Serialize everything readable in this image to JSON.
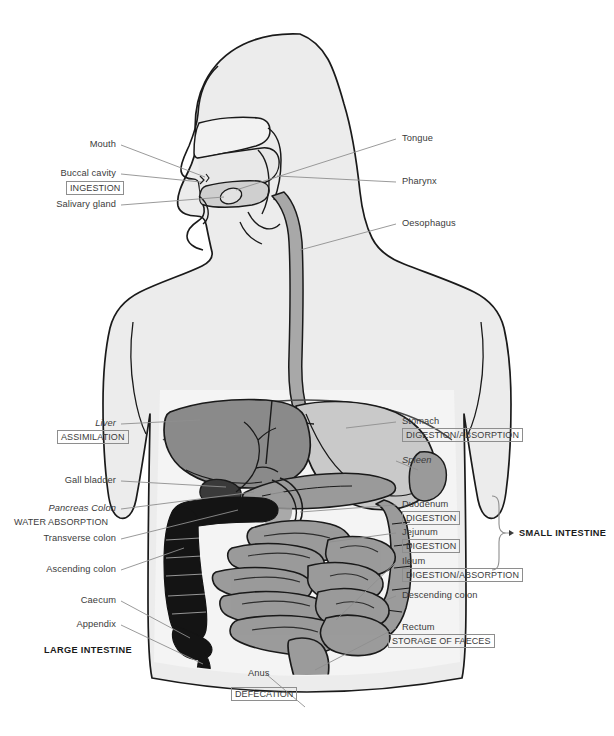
{
  "figure": {
    "orientation": "anterior view of torso with left-facing head profile"
  },
  "palette": {
    "outline": "#1a1a1a",
    "body_fill": "#ececec",
    "body_fill_light": "#f2f2f2",
    "cavity_fill": "#efefef",
    "liver": "#8a8a8a",
    "stomach": "#c9c9c9",
    "spleen": "#9a9a9a",
    "pancreas": "#9a9a9a",
    "gall_bladder": "#4a4a4a",
    "colon_dark": "#141414",
    "small_intestine": "#9b9b9b",
    "large_intestine_gray": "#9b9b9b",
    "oesophagus": "#a8a8a8",
    "leader_line": "#8e8e8e",
    "label_text": "#3b3b3b",
    "bold_text": "#1a1a1a"
  },
  "labels": {
    "left": [
      {
        "id": "mouth",
        "text": "Mouth",
        "style": "plain"
      },
      {
        "id": "buccal-cavity",
        "text": "Buccal cavity",
        "style": "plain"
      },
      {
        "id": "ingestion",
        "text": "INGESTION",
        "style": "boxed"
      },
      {
        "id": "salivary-gland",
        "text": "Salivary gland",
        "style": "plain"
      },
      {
        "id": "liver",
        "text": "Liver",
        "style": "italic"
      },
      {
        "id": "assimilation",
        "text": "ASSIMILATION",
        "style": "boxed"
      },
      {
        "id": "gall-bladder",
        "text": "Gall bladder",
        "style": "plain"
      },
      {
        "id": "pancreas-colon",
        "text": "Pancreas Colon",
        "style": "italic"
      },
      {
        "id": "water-absorption",
        "text": "WATER ABSORPTION",
        "style": "caps"
      },
      {
        "id": "transverse-colon",
        "text": "Transverse colon",
        "style": "plain"
      },
      {
        "id": "ascending-colon",
        "text": "Ascending colon",
        "style": "plain"
      },
      {
        "id": "caecum",
        "text": "Caecum",
        "style": "plain"
      },
      {
        "id": "appendix",
        "text": "Appendix",
        "style": "plain"
      },
      {
        "id": "large-intestine",
        "text": "LARGE INTESTINE",
        "style": "bold"
      }
    ],
    "right": [
      {
        "id": "tongue",
        "text": "Tongue",
        "style": "plain"
      },
      {
        "id": "pharynx",
        "text": "Pharynx",
        "style": "plain"
      },
      {
        "id": "oesophagus",
        "text": "Oesophagus",
        "style": "plain"
      },
      {
        "id": "stomach",
        "text": "Stomach",
        "style": "plain"
      },
      {
        "id": "stomach-function",
        "text": "DIGESTION/ABSORPTION",
        "style": "boxed"
      },
      {
        "id": "spleen",
        "text": "Spleen",
        "style": "italic"
      },
      {
        "id": "duodenum",
        "text": "Duodenum",
        "style": "plain"
      },
      {
        "id": "duodenum-function",
        "text": "DIGESTION",
        "style": "boxed"
      },
      {
        "id": "jejunum",
        "text": "Jejunum",
        "style": "plain"
      },
      {
        "id": "jejunum-function",
        "text": "DIGESTION",
        "style": "boxed"
      },
      {
        "id": "ileum",
        "text": "Ileum",
        "style": "plain"
      },
      {
        "id": "ileum-function",
        "text": "DIGESTION/ABSORPTION",
        "style": "boxed"
      },
      {
        "id": "small-intestine",
        "text": "SMALL INTESTINE",
        "style": "bold"
      },
      {
        "id": "descending-colon",
        "text": "Descending colon",
        "style": "plain"
      },
      {
        "id": "rectum",
        "text": "Rectum",
        "style": "plain"
      },
      {
        "id": "rectum-function",
        "text": "STORAGE OF FAECES",
        "style": "boxed"
      }
    ],
    "bottom": [
      {
        "id": "anus",
        "text": "Anus",
        "style": "plain"
      },
      {
        "id": "defecation",
        "text": "DEFECATION",
        "style": "boxed"
      }
    ]
  },
  "text": {
    "mouth": "Mouth",
    "buccal_cavity": "Buccal cavity",
    "ingestion": "INGESTION",
    "salivary_gland": "Salivary gland",
    "liver": "Liver",
    "assimilation": "ASSIMILATION",
    "gall_bladder": "Gall bladder",
    "pancreas_colon": "Pancreas Colon",
    "water_absorption": "WATER ABSORPTION",
    "transverse_colon": "Transverse colon",
    "ascending_colon": "Ascending colon",
    "caecum": "Caecum",
    "appendix": "Appendix",
    "large_intestine": "LARGE INTESTINE",
    "tongue": "Tongue",
    "pharynx": "Pharynx",
    "oesophagus": "Oesophagus",
    "stomach": "Stomach",
    "stomach_function": "DIGESTION/ABSORPTION",
    "spleen": "Spleen",
    "duodenum": "Duodenum",
    "duodenum_function": "DIGESTION",
    "jejunum": "Jejunum",
    "jejunum_function": "DIGESTION",
    "ileum": "Ileum",
    "ileum_function": "DIGESTION/ABSORPTION",
    "small_intestine": "SMALL INTESTINE",
    "descending_colon": "Descending colon",
    "rectum": "Rectum",
    "rectum_function": "STORAGE OF FAECES",
    "anus": "Anus",
    "defecation": "DEFECATION"
  }
}
